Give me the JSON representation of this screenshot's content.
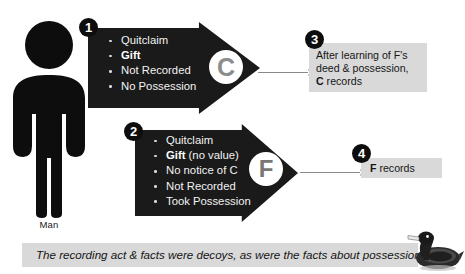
{
  "figure": {
    "person_icon": "person-pictogram",
    "label": "Man"
  },
  "steps": [
    {
      "number": "1",
      "actor_letter": "C",
      "items": [
        {
          "text": "Quitclaim",
          "bold": ""
        },
        {
          "text": "",
          "bold": "Gift"
        },
        {
          "text": "Not Recorded",
          "bold": ""
        },
        {
          "text": "No Possession",
          "bold": ""
        }
      ]
    },
    {
      "number": "2",
      "actor_letter": "F",
      "items": [
        {
          "text": "Quitclaim",
          "bold": ""
        },
        {
          "text": " (no value)",
          "bold": "Gift"
        },
        {
          "text": "No notice of C",
          "bold": ""
        },
        {
          "text": "Not Recorded",
          "bold": ""
        },
        {
          "text": "Took Possession",
          "bold": ""
        }
      ]
    }
  ],
  "results": [
    {
      "number": "3",
      "line1": "After learning of F's",
      "line2": "deed & possession,",
      "line3_bold": "C",
      "line3_rest": " records"
    },
    {
      "number": "4",
      "bold": "F",
      "rest": " records"
    }
  ],
  "caption": {
    "text": "The recording act & facts were decoys, as were the facts about possession."
  },
  "decoration": {
    "duck_icon": "duck-decoy"
  },
  "colors": {
    "arrow_fill": "#1a1a1a",
    "badge_fill": "#0d0d0d",
    "result_box_fill": "#d9d9d9",
    "medallion_letter": "#8c8c8c",
    "background": "#ffffff",
    "connector_line": "#8a8a8a"
  }
}
